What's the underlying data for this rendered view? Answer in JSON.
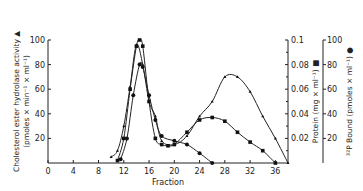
{
  "chart_data": {
    "type": "line",
    "title": "",
    "xlabel": "Fraction",
    "x_ticks": [
      0,
      4,
      8,
      12,
      16,
      20,
      24,
      28,
      32,
      36
    ],
    "xlim": [
      0,
      38
    ],
    "y_axes": [
      {
        "id": "left",
        "label_line1": "Cholesterol ester hydrolase activity ▲",
        "label_line2": "(pmoles × min⁻¹ × ml⁻¹)",
        "ticks": [
          20,
          40,
          60,
          80,
          100
        ],
        "lim": [
          0,
          100
        ]
      },
      {
        "id": "protein",
        "label": "Protein (mg × ml⁻¹) ■",
        "ticks": [
          0.02,
          0.04,
          0.06,
          0.08,
          0.1
        ],
        "tick_labels": [
          "0.02",
          "0.04",
          "0.06",
          "0.08",
          "0.1"
        ],
        "lim": [
          0,
          0.1
        ]
      },
      {
        "id": "bound",
        "label": "³²P Bound (pmoles × ml⁻¹) ●",
        "ticks": [
          20,
          40,
          60,
          80,
          100
        ],
        "lim": [
          0,
          100
        ]
      }
    ],
    "series": [
      {
        "name": "Cholesterol ester hydrolase activity",
        "marker": "triangle",
        "axis": "left",
        "x": [
          10,
          11,
          12,
          13,
          14,
          15,
          16,
          17,
          18,
          20,
          22,
          24,
          26,
          28,
          30,
          32,
          34,
          36,
          38
        ],
        "y": [
          5,
          10,
          30,
          62,
          96,
          80,
          50,
          38,
          18,
          15,
          22,
          38,
          50,
          70,
          70,
          58,
          38,
          20,
          0
        ]
      },
      {
        "name": "Protein",
        "marker": "square",
        "axis": "protein",
        "x": [
          11,
          12,
          13,
          14,
          14.5,
          15,
          16,
          17,
          18,
          19,
          20,
          22,
          24,
          26,
          28,
          30,
          32,
          34,
          36
        ],
        "y": [
          0.002,
          0.02,
          0.06,
          0.095,
          0.1,
          0.095,
          0.05,
          0.02,
          0.015,
          0.014,
          0.015,
          0.025,
          0.035,
          0.037,
          0.034,
          0.025,
          0.017,
          0.01,
          0.0
        ]
      },
      {
        "name": "32P Bound",
        "marker": "circle",
        "axis": "bound",
        "x": [
          11.5,
          12.5,
          13.5,
          14.5,
          15,
          16,
          17,
          18,
          20,
          22,
          24,
          26
        ],
        "y": [
          3,
          20,
          55,
          80,
          78,
          55,
          35,
          22,
          18,
          15,
          8,
          0
        ]
      }
    ]
  }
}
